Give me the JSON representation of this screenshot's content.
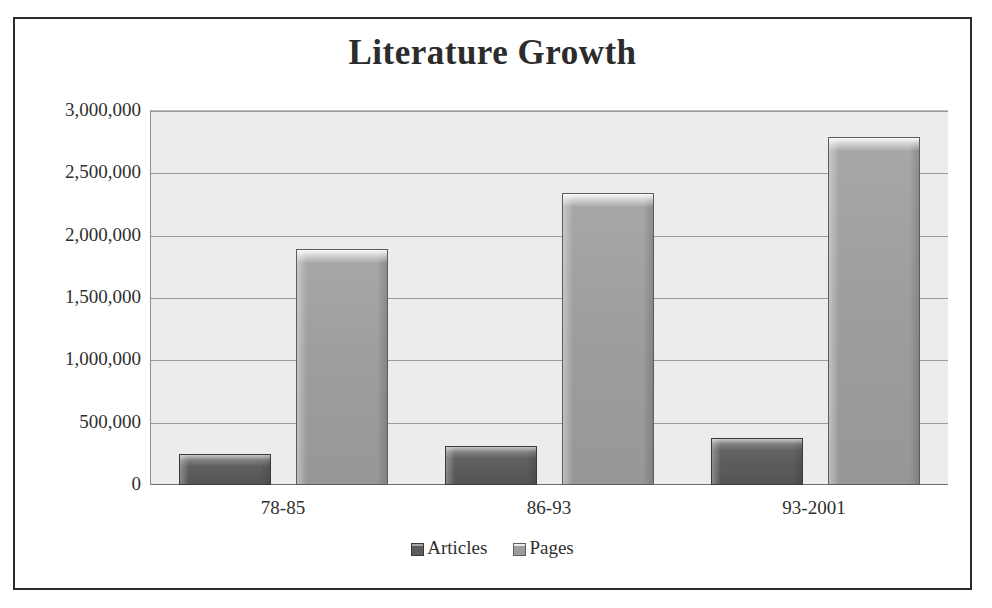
{
  "chart_data": {
    "type": "bar",
    "title": "Literature Growth",
    "categories": [
      "78-85",
      "86-93",
      "93-2001"
    ],
    "series": [
      {
        "name": "Articles",
        "values": [
          250000,
          310000,
          380000
        ],
        "color": "#5c5c5c"
      },
      {
        "name": "Pages",
        "values": [
          1890000,
          2340000,
          2790000
        ],
        "color": "#9d9d9d"
      }
    ],
    "xlabel": "",
    "ylabel": "",
    "ylim": [
      0,
      3000000
    ],
    "ytick_labels": [
      "3,000,000",
      "2,500,000",
      "2,000,000",
      "1,500,000",
      "1,000,000",
      "500,000",
      "0"
    ],
    "ytick_values": [
      3000000,
      2500000,
      2000000,
      1500000,
      1000000,
      500000,
      0
    ],
    "grid": true,
    "legend_position": "bottom",
    "plot_background": "#ececec",
    "gridline_color": "#9a9a9a",
    "border_color": "#2b2b2b"
  },
  "legend": {
    "items": [
      {
        "label": "Articles",
        "swatch": "articles-swatch"
      },
      {
        "label": "Pages",
        "swatch": "pages-swatch"
      }
    ]
  }
}
